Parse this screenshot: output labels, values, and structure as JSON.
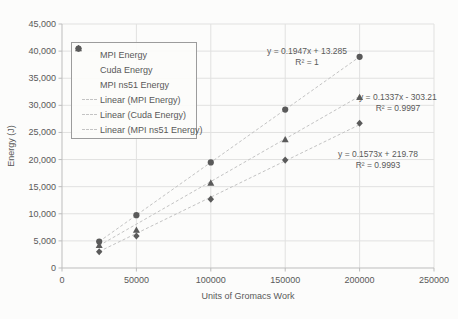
{
  "chart_data": {
    "type": "scatter",
    "title": "",
    "xlabel": "Units of Gromacs Work",
    "ylabel": "Energy (J)",
    "xlim": [
      0,
      250000
    ],
    "ylim": [
      0,
      45000
    ],
    "grid": true,
    "legend_position": "upper-left-inside",
    "xtick_values": [
      0,
      50000,
      100000,
      150000,
      200000,
      250000
    ],
    "xtick_labels": [
      "0",
      "50000",
      "100000",
      "150000",
      "200000",
      "250000"
    ],
    "ytick_values": [
      0,
      5000,
      10000,
      15000,
      20000,
      25000,
      30000,
      35000,
      40000,
      45000
    ],
    "ytick_labels": [
      "0",
      "5,000",
      "10,000",
      "15,000",
      "20,000",
      "25,000",
      "30,000",
      "35,000",
      "40,000",
      "45,000"
    ],
    "x": [
      25000,
      50000,
      100000,
      150000,
      200000
    ],
    "series": [
      {
        "name": "MPI Energy",
        "marker": "diamond",
        "values": [
          3000,
          5900,
          12700,
          19900,
          26700
        ],
        "trend": {
          "label": "Linear (MPI Energy)",
          "slope": 0.1337,
          "intercept": -303.21,
          "equation": "y = 0.1337x - 303.21",
          "r2": "R² = 0.9997"
        }
      },
      {
        "name": "Cuda Energy",
        "marker": "triangle",
        "values": [
          4200,
          7000,
          15700,
          23700,
          31500
        ],
        "trend": {
          "label": "Linear (Cuda Energy)",
          "slope": 0.1573,
          "intercept": 219.78,
          "equation": "y = 0.1573x + 219.78",
          "r2": "R² = 0.9993"
        }
      },
      {
        "name": "MPI ns51 Energy",
        "marker": "circle",
        "values": [
          4880,
          9750,
          19480,
          29220,
          38950
        ],
        "trend": {
          "label": "Linear (MPI ns51 Energy)",
          "slope": 0.1947,
          "intercept": 13.285,
          "equation": "y = 0.1947x + 13.285",
          "r2": "R² = 1"
        }
      }
    ],
    "colors": {
      "marker": "#5a5a5a",
      "trendline": "#c3c3c3",
      "gridline": "#e1e1e0",
      "axis": "#bdbdbd",
      "text": "#595959",
      "legend_border": "#9c9c9c",
      "background": "#fcfcfb"
    }
  }
}
